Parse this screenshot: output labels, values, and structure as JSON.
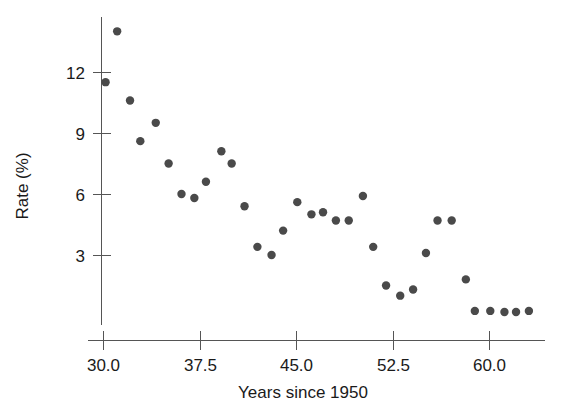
{
  "chart_data": {
    "type": "scatter",
    "title": "",
    "xlabel": "Years since 1950",
    "ylabel": "Rate (%)",
    "xlim": [
      29.2,
      64.0
    ],
    "ylim": [
      -0.3,
      14.8
    ],
    "xticks": [
      30.0,
      37.5,
      45.0,
      52.5,
      60.0
    ],
    "xticklabels": [
      "30.0",
      "37.5",
      "45.0",
      "52.5",
      "60.0"
    ],
    "yticks": [
      3,
      6,
      9,
      12
    ],
    "yticklabels": [
      "3",
      "6",
      "9",
      "12"
    ],
    "grid": false,
    "legend": null,
    "marker_color": "#4a4a4a",
    "marker_size": 6,
    "points": [
      {
        "x": 30.2,
        "y": 11.5
      },
      {
        "x": 31.1,
        "y": 14.0
      },
      {
        "x": 32.1,
        "y": 10.6
      },
      {
        "x": 32.9,
        "y": 8.6
      },
      {
        "x": 34.1,
        "y": 9.5
      },
      {
        "x": 35.1,
        "y": 7.5
      },
      {
        "x": 36.1,
        "y": 6.0
      },
      {
        "x": 37.1,
        "y": 5.8
      },
      {
        "x": 38.0,
        "y": 6.6
      },
      {
        "x": 39.2,
        "y": 8.1
      },
      {
        "x": 40.0,
        "y": 7.5
      },
      {
        "x": 41.0,
        "y": 5.4
      },
      {
        "x": 42.0,
        "y": 3.4
      },
      {
        "x": 43.1,
        "y": 3.0
      },
      {
        "x": 44.0,
        "y": 4.2
      },
      {
        "x": 45.1,
        "y": 5.6
      },
      {
        "x": 46.2,
        "y": 5.0
      },
      {
        "x": 47.1,
        "y": 5.1
      },
      {
        "x": 48.1,
        "y": 4.7
      },
      {
        "x": 49.1,
        "y": 4.7
      },
      {
        "x": 50.2,
        "y": 5.9
      },
      {
        "x": 51.0,
        "y": 3.4
      },
      {
        "x": 52.0,
        "y": 1.5
      },
      {
        "x": 53.1,
        "y": 1.0
      },
      {
        "x": 54.1,
        "y": 1.3
      },
      {
        "x": 55.1,
        "y": 3.1
      },
      {
        "x": 56.0,
        "y": 4.7
      },
      {
        "x": 57.1,
        "y": 4.7
      },
      {
        "x": 58.2,
        "y": 1.8
      },
      {
        "x": 58.9,
        "y": 0.25
      },
      {
        "x": 60.1,
        "y": 0.25
      },
      {
        "x": 61.2,
        "y": 0.2
      },
      {
        "x": 62.1,
        "y": 0.2
      },
      {
        "x": 63.1,
        "y": 0.25
      }
    ]
  },
  "axes": {
    "y_axis_name": "rate-percent-axis",
    "x_axis_name": "years-since-1950-axis"
  }
}
